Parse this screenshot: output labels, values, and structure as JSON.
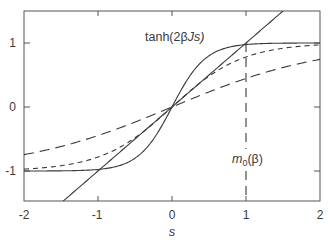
{
  "chart_data": {
    "type": "line",
    "title": "",
    "xlabel": "s",
    "ylabel": "",
    "xlim": [
      -2,
      2
    ],
    "ylim": [
      -1.5,
      1.5
    ],
    "grid": false,
    "legend": null,
    "x_ticks": [
      -2,
      -1,
      0,
      1,
      2
    ],
    "x_tick_labels": [
      "-2",
      "-1",
      "0",
      "1",
      "2"
    ],
    "y_ticks": [
      -1,
      0,
      1
    ],
    "y_tick_labels": [
      "-1",
      "0",
      "1"
    ],
    "series": [
      {
        "name": "s (identity line)",
        "style": "solid",
        "formula": "y = s",
        "x": [
          -1.5,
          -1,
          0,
          1,
          1.5
        ],
        "values": [
          -1.5,
          -1,
          0,
          1,
          1.5
        ]
      },
      {
        "name": "tanh(2βJs), low T",
        "style": "solid",
        "formula": "tanh(2.2 s)",
        "x": [
          -2,
          -1.5,
          -1,
          -0.5,
          0,
          0.5,
          1,
          1.5,
          2
        ],
        "values": [
          -1.0,
          -1.0,
          -0.98,
          -0.8,
          0,
          0.8,
          0.98,
          1.0,
          1.0
        ]
      },
      {
        "name": "tanh(2βJs), intermediate",
        "style": "short-dash",
        "formula": "tanh(1.05 s)",
        "x": [
          -2,
          -1.5,
          -1,
          -0.5,
          0,
          0.5,
          1,
          1.5,
          2
        ],
        "values": [
          -0.97,
          -0.92,
          -0.78,
          -0.48,
          0,
          0.48,
          0.78,
          0.92,
          0.97
        ]
      },
      {
        "name": "tanh(2βJs), high T",
        "style": "long-dash",
        "formula": "tanh(0.48 s)",
        "x": [
          -2,
          -1.5,
          -1,
          -0.5,
          0,
          0.5,
          1,
          1.5,
          2
        ],
        "values": [
          -0.75,
          -0.62,
          -0.45,
          -0.24,
          0,
          0.24,
          0.45,
          0.62,
          0.75
        ]
      }
    ],
    "annotations": [
      {
        "text": "tanh(2βJs)",
        "x": -0.35,
        "y": 1.2
      },
      {
        "text": "m0(β)",
        "x": 1.0,
        "y": -0.7,
        "note": "vertical dashed line at s = m0(β) ≈ 1 from the curve/line intersection down to the x-axis"
      }
    ]
  },
  "labels": {
    "curve_label_prefix": "tanh(2",
    "curve_label_beta": "β",
    "curve_label_suffix": "Js)",
    "m0_m": "m",
    "m0_sub": "0",
    "m0_arg": "(β)",
    "xlabel": "s",
    "xt0": "-2",
    "xt1": "-1",
    "xt2": "0",
    "xt3": "1",
    "xt4": "2",
    "yt0": "1",
    "yt1": "0",
    "yt2": "-1"
  },
  "colors": {
    "line": "#3a3a3a",
    "frame": "#555555"
  }
}
